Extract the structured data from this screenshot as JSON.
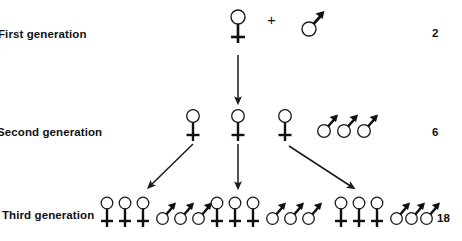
{
  "diagram": {
    "title_visible": false,
    "type": "genetics-pedigree",
    "background_color": "#ffffff",
    "ink_color": "#111111"
  },
  "rows": [
    {
      "label": "First generation",
      "label_truncated_left": true,
      "count": "2",
      "females": 1,
      "males": 1,
      "operator": "+"
    },
    {
      "label": "Second generation",
      "label_truncated_left": true,
      "count": "6",
      "females": 3,
      "males": 3,
      "operator": ""
    },
    {
      "label": "Third generation",
      "label_truncated_left": false,
      "count": "18",
      "females": 9,
      "males": 9,
      "operator": ""
    }
  ],
  "symbols": {
    "female_name": "female-symbol",
    "male_name": "male-symbol",
    "plus_name": "plus-sign"
  },
  "connectors": [
    {
      "name": "arrow-gen1-to-gen2",
      "direction": "down"
    },
    {
      "name": "arrow-gen2-left-to-gen3",
      "direction": "down-left"
    },
    {
      "name": "arrow-gen2-middle-to-gen3",
      "direction": "down"
    },
    {
      "name": "arrow-gen2-right-to-gen3",
      "direction": "down-right"
    }
  ],
  "labels": {
    "row1": "First generation",
    "row2": "Second generation",
    "row3": "Third generation",
    "count1": "2",
    "count2": "6",
    "count3": "18",
    "plus": "+"
  }
}
